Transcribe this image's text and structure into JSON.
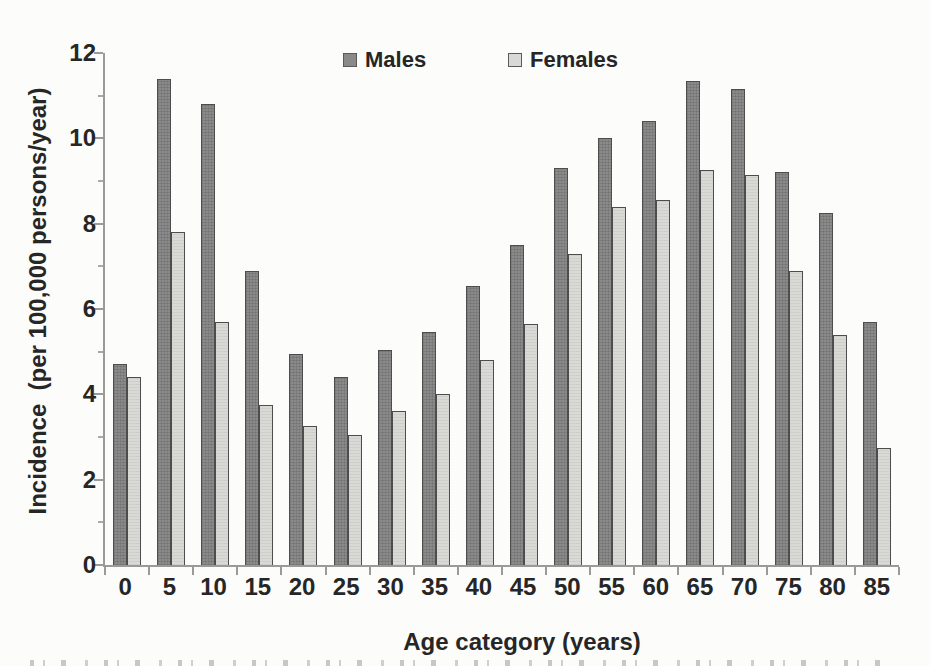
{
  "figure": {
    "background": "#fcfcfa",
    "text_color": "#262626",
    "axis_color": "#9b9b95"
  },
  "chart_data": {
    "type": "bar",
    "title": "",
    "xlabel": "Age category (years)",
    "ylabel": "Incidence  (per 100,000 persons/year)",
    "categories": [
      "0",
      "5",
      "10",
      "15",
      "20",
      "25",
      "30",
      "35",
      "40",
      "45",
      "50",
      "55",
      "60",
      "65",
      "70",
      "75",
      "80",
      "85"
    ],
    "series": [
      {
        "name": "Males",
        "color": "#8a8a8a",
        "border": "#4d4d4d",
        "values": [
          4.7,
          11.4,
          10.8,
          6.9,
          4.95,
          4.4,
          5.05,
          5.45,
          6.55,
          7.5,
          9.3,
          10.0,
          10.4,
          11.35,
          11.15,
          9.2,
          8.25,
          5.7
        ]
      },
      {
        "name": "Females",
        "color": "#d9d9d5",
        "border": "#4d4d4d",
        "values": [
          4.4,
          7.8,
          5.7,
          3.75,
          3.25,
          3.05,
          3.6,
          4.0,
          4.8,
          5.65,
          7.3,
          8.4,
          8.55,
          9.25,
          9.15,
          6.9,
          5.4,
          2.75
        ]
      }
    ],
    "ylim": [
      0,
      12
    ],
    "yticks": [
      0,
      2,
      4,
      6,
      8,
      10,
      12
    ],
    "yticks_minor": [
      1,
      3,
      5,
      7,
      9,
      11
    ],
    "grid": false,
    "legend_position": "top-center"
  }
}
